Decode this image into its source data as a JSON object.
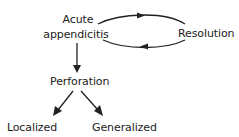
{
  "diagram": {
    "type": "flowchart",
    "nodes": {
      "acute_line1": "Acute",
      "acute_line2": "appendicitis",
      "resolution": "Resolution",
      "perforation": "Perforation",
      "localized": "Localized",
      "generalized": "Generalized"
    },
    "edges": [
      {
        "from": "Acute appendicitis",
        "to": "Resolution",
        "style": "curved-top"
      },
      {
        "from": "Resolution",
        "to": "Acute appendicitis",
        "style": "curved-bottom"
      },
      {
        "from": "Acute appendicitis",
        "to": "Perforation",
        "style": "straight-down"
      },
      {
        "from": "Perforation",
        "to": "Localized",
        "style": "diagonal-left"
      },
      {
        "from": "Perforation",
        "to": "Generalized",
        "style": "diagonal-right"
      }
    ],
    "colors": {
      "stroke": "#222222",
      "text": "#222222",
      "background": "#ffffff"
    }
  }
}
